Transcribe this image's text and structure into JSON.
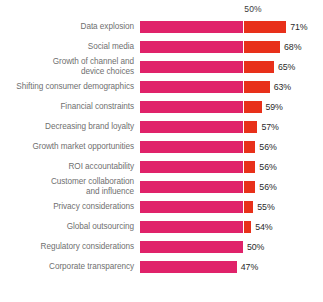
{
  "chart_data": {
    "type": "bar",
    "orientation": "horizontal",
    "title": "",
    "subtitle": "",
    "xlabel": "",
    "ylabel": "",
    "grid": false,
    "legend": "none",
    "axis_ticks": [
      "50%"
    ],
    "axis_tick_values": [
      50
    ],
    "xlim": [
      0,
      75
    ],
    "value_suffix": "%",
    "threshold": 50,
    "colors": {
      "below_threshold": "#E0226A",
      "above_threshold": "#E8301A",
      "label_text": "#6f6f6f",
      "value_text": "#2a2a2a",
      "axis_text": "#3b3b3b",
      "background": "#ffffff"
    },
    "categories": [
      "Data explosion",
      "Social media",
      "Growth of channel and\ndevice choices",
      "Shifting consumer demographics",
      "Financial constraints",
      "Decreasing brand loyalty",
      "Growth market opportunities",
      "ROI accountability",
      "Customer collaboration\nand influence",
      "Privacy considerations",
      "Global outsourcing",
      "Regulatory considerations",
      "Corporate transparency"
    ],
    "values": [
      71,
      68,
      65,
      63,
      59,
      57,
      56,
      56,
      56,
      55,
      54,
      50,
      47
    ],
    "value_labels": [
      "71%",
      "68%",
      "65%",
      "63%",
      "59%",
      "57%",
      "56%",
      "56%",
      "56%",
      "55%",
      "54%",
      "50%",
      "47%"
    ],
    "series": [
      {
        "name": "Percent citing as a factor",
        "values": [
          71,
          68,
          65,
          63,
          59,
          57,
          56,
          56,
          56,
          55,
          54,
          50,
          47
        ]
      }
    ]
  },
  "axis": {
    "tick_50_label": "50%"
  }
}
